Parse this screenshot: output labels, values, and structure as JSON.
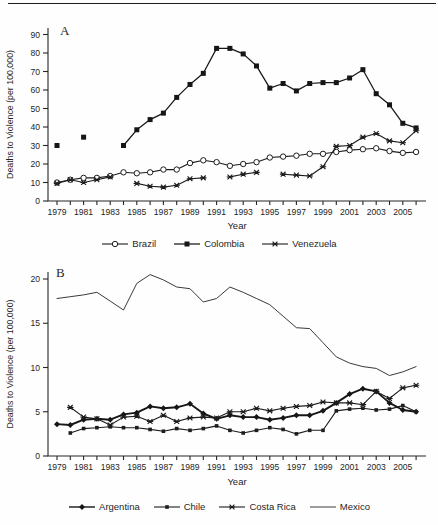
{
  "figure": {
    "panel_a_label": "A",
    "panel_b_label": "B"
  },
  "chart_data": [
    {
      "type": "line",
      "panel_label": "A",
      "xlabel": "Year",
      "ylabel": "Deaths to Violence (per 100,000)",
      "ylim": [
        0,
        90
      ],
      "yticks": [
        0,
        10,
        20,
        30,
        40,
        50,
        60,
        70,
        80,
        90
      ],
      "xtick_labels": [
        1979,
        1981,
        1983,
        1985,
        1987,
        1989,
        1991,
        1993,
        1995,
        1997,
        1999,
        2001,
        2003,
        2005
      ],
      "grid": false,
      "legend_position": "bottom",
      "years": [
        1979,
        1980,
        1981,
        1982,
        1983,
        1984,
        1985,
        1986,
        1987,
        1988,
        1989,
        1990,
        1991,
        1992,
        1993,
        1994,
        1995,
        1996,
        1997,
        1998,
        1999,
        2000,
        2001,
        2002,
        2003,
        2004,
        2005,
        2006
      ],
      "series": [
        {
          "name": "Brazil",
          "marker": "open-circle",
          "stroke_width": 1.1,
          "color": "#1d1d1d",
          "values": [
            10,
            11.5,
            12.5,
            12.5,
            13.5,
            15.5,
            15,
            15.5,
            17,
            17,
            20.5,
            22,
            21,
            19,
            20,
            21,
            23.5,
            24,
            24.5,
            25.5,
            25.5,
            26.5,
            27.5,
            28,
            28.5,
            27,
            26,
            26.5
          ]
        },
        {
          "name": "Colombia",
          "marker": "filled-square",
          "stroke_width": 1.25,
          "color": "#161616",
          "values": [
            30,
            null,
            34.5,
            null,
            null,
            30,
            38.5,
            44,
            47.5,
            56,
            63,
            69,
            82.5,
            82.5,
            79.5,
            73,
            61,
            63.5,
            59.5,
            63.5,
            64,
            64,
            66.5,
            71,
            58,
            52,
            42,
            39.5
          ]
        },
        {
          "name": "Venezuela",
          "marker": "asterisk",
          "stroke_width": 1.1,
          "color": "#1d1d1d",
          "values": [
            9.5,
            11.5,
            10,
            11.5,
            13,
            null,
            9.5,
            8,
            7.5,
            8.5,
            12,
            12.5,
            null,
            13,
            14.5,
            15.5,
            null,
            14.5,
            14,
            13.5,
            18.5,
            29.5,
            30,
            34.5,
            36.5,
            32.5,
            31.5,
            38
          ]
        }
      ]
    },
    {
      "type": "line",
      "panel_label": "B",
      "xlabel": "Year",
      "ylabel": "Deaths to Violence (per 100,000)",
      "ylim": [
        0,
        20
      ],
      "yticks": [
        0,
        5,
        10,
        15,
        20
      ],
      "xtick_labels": [
        1979,
        1981,
        1983,
        1985,
        1987,
        1989,
        1991,
        1993,
        1995,
        1997,
        1999,
        2001,
        2003,
        2005
      ],
      "grid": false,
      "legend_position": "bottom",
      "years": [
        1979,
        1980,
        1981,
        1982,
        1983,
        1984,
        1985,
        1986,
        1987,
        1988,
        1989,
        1990,
        1991,
        1992,
        1993,
        1994,
        1995,
        1996,
        1997,
        1998,
        1999,
        2000,
        2001,
        2002,
        2003,
        2004,
        2005,
        2006
      ],
      "series": [
        {
          "name": "Argentina",
          "marker": "filled-diamond",
          "stroke_width": 1.9,
          "color": "#161616",
          "values": [
            3.6,
            3.5,
            4.1,
            4.2,
            4.1,
            4.7,
            4.9,
            5.6,
            5.4,
            5.5,
            5.9,
            4.8,
            4.2,
            4.6,
            4.4,
            4.4,
            4.1,
            4.3,
            4.6,
            4.6,
            5.1,
            6,
            7,
            7.6,
            7.3,
            6,
            5.2,
            5
          ]
        },
        {
          "name": "Chile",
          "marker": "small-filled-square",
          "stroke_width": 1.1,
          "color": "#1d1d1d",
          "values": [
            null,
            2.6,
            3.1,
            3.2,
            3.3,
            3.2,
            3.2,
            3,
            2.8,
            3.1,
            2.9,
            3.1,
            3.4,
            2.9,
            2.6,
            2.9,
            3.2,
            3,
            2.5,
            2.9,
            2.9,
            5.1,
            5.3,
            5.4,
            5.2,
            5.3,
            5.7,
            5
          ]
        },
        {
          "name": "Costa Rica",
          "marker": "asterisk",
          "stroke_width": 1.1,
          "color": "#1d1d1d",
          "values": [
            null,
            5.5,
            4.4,
            4.2,
            3.5,
            4.4,
            4.5,
            3.9,
            4.6,
            3.9,
            4.3,
            4.4,
            4.3,
            5,
            5,
            5.4,
            5.1,
            5.4,
            5.6,
            5.7,
            6.1,
            6,
            6,
            5.8,
            7.3,
            6.5,
            7.7,
            8
          ]
        },
        {
          "name": "Mexico",
          "marker": "none",
          "stroke_width": 1.0,
          "color": "#3a3a3a",
          "values": [
            17.8,
            18,
            18.2,
            18.5,
            17.5,
            16.5,
            19.5,
            20.5,
            19.9,
            19.1,
            18.9,
            17.4,
            17.8,
            19.1,
            18.5,
            17.8,
            17.1,
            15.8,
            14.5,
            14.4,
            12.8,
            11.2,
            10.5,
            10.1,
            9.9,
            9.1,
            9.5,
            10.1
          ]
        }
      ]
    }
  ]
}
